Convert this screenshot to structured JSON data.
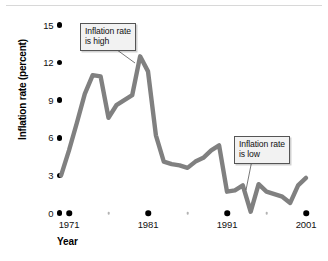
{
  "chart_data": {
    "type": "line",
    "title": "",
    "xlabel": "Year",
    "ylabel": "Inflation rate (percent)",
    "xlim": [
      1970,
      2001
    ],
    "ylim": [
      0,
      15
    ],
    "grid": false,
    "legend": null,
    "y_ticks": [
      0,
      3,
      6,
      9,
      12,
      15
    ],
    "y_tick_labels": [
      "0",
      "3",
      "6",
      "9",
      "12",
      "15"
    ],
    "x_ticks": [
      1971,
      1981,
      1991,
      2001
    ],
    "x_tick_labels": [
      "1971",
      "1981",
      "1991",
      "2001"
    ],
    "x_minor_ticks": [
      1976,
      1986,
      1996
    ],
    "series_name": "Inflation rate",
    "line_color": "#808080",
    "x": [
      1970,
      1971,
      1972,
      1973,
      1974,
      1975,
      1976,
      1977,
      1978,
      1979,
      1980,
      1981,
      1982,
      1983,
      1984,
      1985,
      1986,
      1987,
      1988,
      1989,
      1990,
      1991,
      1992,
      1993,
      1994,
      1995,
      1996,
      1997,
      1998,
      1999,
      2000,
      2001
    ],
    "values": [
      3.0,
      5.0,
      7.2,
      9.5,
      11.0,
      10.9,
      7.6,
      8.6,
      9.0,
      9.4,
      12.5,
      11.3,
      6.2,
      4.1,
      3.9,
      3.8,
      3.6,
      4.1,
      4.4,
      5.0,
      5.4,
      1.7,
      1.8,
      2.2,
      0.1,
      2.3,
      1.7,
      1.5,
      1.3,
      0.8,
      2.2,
      2.8
    ],
    "annotations": [
      {
        "id": "high",
        "text_line1": "Inflation rate",
        "text_line2": "is high",
        "points_to_year": 1980,
        "points_to_value": 12.5
      },
      {
        "id": "low",
        "text_line1": "Inflation rate",
        "text_line2": "is low",
        "points_to_year": 1994,
        "points_to_value": 0.1
      }
    ]
  }
}
